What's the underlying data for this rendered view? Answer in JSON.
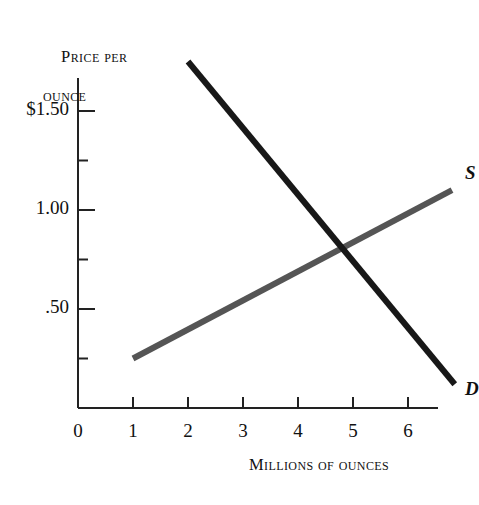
{
  "figure": {
    "background_color": "#ffffff",
    "y_axis_title_line1": "Price per",
    "y_axis_title_line2": "ounce",
    "x_axis_title": "Millions of ounces",
    "origin_label": "0"
  },
  "labels": {
    "supply": "S",
    "demand": "D"
  },
  "y_ticks": [
    {
      "label": "$1.50",
      "value": 1.5
    },
    {
      "label": "1.00",
      "value": 1.0
    },
    {
      "label": ".50",
      "value": 0.5
    }
  ],
  "x_ticks": [
    {
      "label": "1",
      "value": 1
    },
    {
      "label": "2",
      "value": 2
    },
    {
      "label": "3",
      "value": 3
    },
    {
      "label": "4",
      "value": 4
    },
    {
      "label": "5",
      "value": 5
    },
    {
      "label": "6",
      "value": 6
    }
  ],
  "chart_data": {
    "type": "line",
    "title": "",
    "xlabel": "Millions of ounces",
    "ylabel": "Price per ounce",
    "xlim": [
      0,
      7.2
    ],
    "ylim": [
      0,
      1.95
    ],
    "grid": false,
    "legend": "inline-curve-labels",
    "x_tick_values": [
      1,
      2,
      3,
      4,
      5,
      6
    ],
    "x_tick_labels": [
      "1",
      "2",
      "3",
      "4",
      "5",
      "6"
    ],
    "y_tick_values": [
      0.5,
      1.0,
      1.5
    ],
    "y_tick_labels": [
      ".50",
      "1.00",
      "$1.50"
    ],
    "y_minor_tick_values": [
      0.25,
      0.75,
      1.25
    ],
    "series": [
      {
        "name": "S",
        "label": "Supply",
        "color": "#555555",
        "line_width": 6,
        "points": [
          {
            "x": 1.0,
            "y": 0.25
          },
          {
            "x": 6.8,
            "y": 1.1
          }
        ]
      },
      {
        "name": "D",
        "label": "Demand",
        "color": "#181818",
        "line_width": 6,
        "points": [
          {
            "x": 2.0,
            "y": 1.75
          },
          {
            "x": 6.85,
            "y": 0.12
          }
        ]
      }
    ],
    "equilibrium": {
      "x": 4.9,
      "y": 0.79
    },
    "annotations": [
      {
        "text": "S",
        "x": 7.0,
        "y": 1.18
      },
      {
        "text": "D",
        "x": 7.0,
        "y": 0.09
      }
    ]
  },
  "colors": {
    "axis": "#222222",
    "supply_curve": "#555555",
    "demand_curve": "#181818",
    "text": "#111111"
  }
}
